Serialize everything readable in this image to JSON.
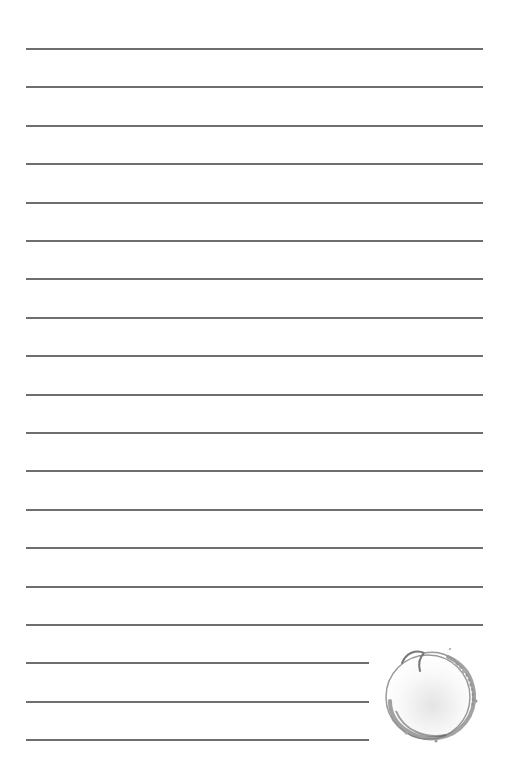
{
  "page": {
    "type": "lined-notepaper",
    "background": "#ffffff",
    "line_color": "#6e6e6e",
    "line_count": 19,
    "full_width_lines": 16,
    "short_lines": 3
  },
  "decoration": {
    "icon": "wreath-circle-illustration"
  }
}
